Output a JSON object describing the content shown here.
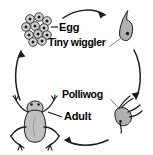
{
  "diagram": {
    "type": "cycle-diagram",
    "direction": "clockwise",
    "background_color": "#ffffff",
    "ink_color": "#1a1a1a",
    "fill_color": "#b8b8b8",
    "stages": [
      {
        "id": "egg",
        "label": "Egg",
        "position": "top-left",
        "illustration": "egg-cluster-icon",
        "description": "cluster of round eggs with dark centers"
      },
      {
        "id": "tiny-wiggler",
        "label": "Tiny wiggler",
        "position": "top-right",
        "illustration": "tadpole-hatchling-icon",
        "description": "small tadpole with long curved tail"
      },
      {
        "id": "polliwog",
        "label": "Polliwog",
        "position": "bottom-right",
        "illustration": "tadpole-with-legs-icon",
        "description": "tadpole with developing hind and front legs"
      },
      {
        "id": "adult",
        "label": "Adult",
        "position": "bottom-left",
        "illustration": "frog-icon",
        "description": "adult frog viewed from above with splayed legs"
      }
    ],
    "arrows": [
      {
        "id": "arrow-egg-to-wiggler",
        "from": "egg",
        "to": "tiny-wiggler",
        "position": "top",
        "points": "right"
      },
      {
        "id": "arrow-wiggler-to-polliwog",
        "from": "tiny-wiggler",
        "to": "polliwog",
        "position": "right",
        "points": "down"
      },
      {
        "id": "arrow-polliwog-to-adult",
        "from": "polliwog",
        "to": "adult",
        "position": "bottom",
        "points": "left"
      },
      {
        "id": "arrow-adult-to-egg",
        "from": "adult",
        "to": "egg",
        "position": "left",
        "points": "up"
      }
    ],
    "leader_lines": [
      {
        "id": "leader-egg",
        "for": "egg"
      },
      {
        "id": "leader-tiny-wiggler",
        "for": "tiny-wiggler"
      },
      {
        "id": "leader-polliwog",
        "for": "polliwog"
      },
      {
        "id": "leader-adult",
        "for": "adult"
      }
    ]
  }
}
